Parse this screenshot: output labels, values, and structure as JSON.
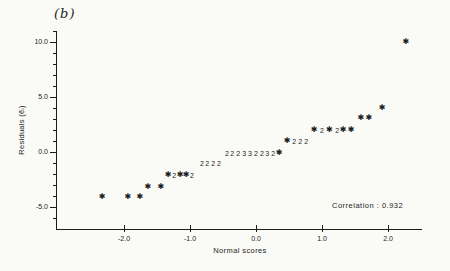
{
  "chart_data": {
    "type": "scatter",
    "panel_label": "(b)",
    "xlabel": "Normal scores",
    "ylabel": "Residuals (ẽᵢ)",
    "annotation": "Correlation : 0.932",
    "xlim": [
      -3.0,
      2.5
    ],
    "ylim": [
      -7.1,
      10.9
    ],
    "grid": false,
    "ink_color": "#1c1c1c",
    "paper_color": "#fafaf7",
    "marker_glyphs": {
      "star": "✱"
    },
    "x_axis": {
      "ticks": [
        {
          "v": -2.0,
          "label": "-2.0"
        },
        {
          "v": -1.0,
          "label": "-1.0"
        },
        {
          "v": 0.0,
          "label": "0.0"
        },
        {
          "v": 1.0,
          "label": "1.0"
        },
        {
          "v": 2.0,
          "label": "2.0"
        }
      ]
    },
    "y_axis": {
      "major_ticks": [
        {
          "v": 10.0,
          "label": "10.0"
        },
        {
          "v": 5.0,
          "label": "5.0"
        },
        {
          "v": 0.0,
          "label": "0.0"
        },
        {
          "v": -5.0,
          "label": "-5.0"
        }
      ],
      "minor_ticks": [
        -6,
        -4,
        -3,
        -2,
        -1,
        1,
        2,
        3,
        4,
        6,
        7,
        8,
        9,
        11
      ]
    },
    "points": [
      {
        "x": -2.33,
        "y": -4.1,
        "m": "star"
      },
      {
        "x": -1.94,
        "y": -4.1,
        "m": "star"
      },
      {
        "x": -1.76,
        "y": -4.1,
        "m": "star"
      },
      {
        "x": -1.64,
        "y": -3.2,
        "m": "star"
      },
      {
        "x": -1.44,
        "y": -3.2,
        "m": "star"
      },
      {
        "x": -1.33,
        "y": -2.1,
        "m": "star"
      },
      {
        "x": -1.24,
        "y": -2.1,
        "m": "2"
      },
      {
        "x": -1.15,
        "y": -2.1,
        "m": "star"
      },
      {
        "x": -1.06,
        "y": -2.1,
        "m": "star"
      },
      {
        "x": -0.97,
        "y": -2.1,
        "m": "2"
      },
      {
        "x": -0.82,
        "y": -1.0,
        "m": "2"
      },
      {
        "x": -0.74,
        "y": -1.0,
        "m": "2"
      },
      {
        "x": -0.65,
        "y": -1.0,
        "m": "2"
      },
      {
        "x": -0.56,
        "y": -1.0,
        "m": "2"
      },
      {
        "x": -0.44,
        "y": -0.1,
        "m": "2"
      },
      {
        "x": -0.36,
        "y": -0.1,
        "m": "2"
      },
      {
        "x": -0.27,
        "y": -0.1,
        "m": "2"
      },
      {
        "x": -0.18,
        "y": -0.1,
        "m": "3"
      },
      {
        "x": -0.09,
        "y": -0.1,
        "m": "3"
      },
      {
        "x": 0.0,
        "y": -0.1,
        "m": "2"
      },
      {
        "x": 0.09,
        "y": -0.1,
        "m": "2"
      },
      {
        "x": 0.17,
        "y": -0.1,
        "m": "3"
      },
      {
        "x": 0.26,
        "y": -0.1,
        "m": "2"
      },
      {
        "x": 0.35,
        "y": -0.1,
        "m": "star"
      },
      {
        "x": 0.47,
        "y": 1.0,
        "m": "star"
      },
      {
        "x": 0.58,
        "y": 1.0,
        "m": "2"
      },
      {
        "x": 0.67,
        "y": 1.0,
        "m": "2"
      },
      {
        "x": 0.76,
        "y": 1.0,
        "m": "2"
      },
      {
        "x": 0.88,
        "y": 2.0,
        "m": "star"
      },
      {
        "x": 1.0,
        "y": 2.0,
        "m": "2"
      },
      {
        "x": 1.11,
        "y": 2.0,
        "m": "star"
      },
      {
        "x": 1.23,
        "y": 2.0,
        "m": "2"
      },
      {
        "x": 1.32,
        "y": 2.0,
        "m": "star"
      },
      {
        "x": 1.44,
        "y": 2.0,
        "m": "star"
      },
      {
        "x": 1.59,
        "y": 3.1,
        "m": "star"
      },
      {
        "x": 1.71,
        "y": 3.1,
        "m": "star"
      },
      {
        "x": 1.91,
        "y": 4.0,
        "m": "star"
      },
      {
        "x": 2.27,
        "y": 10.0,
        "m": "star"
      }
    ]
  }
}
